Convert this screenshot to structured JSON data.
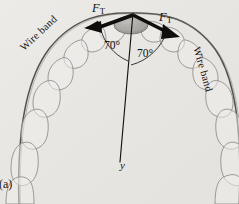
{
  "figure": {
    "panel_label": "(a)",
    "background_color": "#e9e7e4",
    "ink_color": "#14110f",
    "tooth_outline_color": "#8d8a86",
    "band_color": "#6f6c68",
    "bracket_fill": "#a7a5a2"
  },
  "labels": {
    "force_left": "F",
    "force_left_sub": "T",
    "force_right": "F",
    "force_right_sub": "T",
    "angle_left": "70°",
    "angle_right": "70°",
    "wire_band_left": "Wire band",
    "wire_band_right": "Wire band",
    "y_axis": "y"
  },
  "diagram_data": {
    "type": "free-body-diagram",
    "subject": "orthodontic wire band on dental arch",
    "vertex": {
      "x": 133,
      "y": 14
    },
    "angle_between_force_and_y_axis_deg": 70,
    "forces": [
      {
        "name": "F_T",
        "side": "left",
        "magnitude_label": "F_T",
        "direction_deg_from_y_axis": 70
      },
      {
        "name": "F_T",
        "side": "right",
        "magnitude_label": "F_T",
        "direction_deg_from_y_axis": 70
      }
    ],
    "axes": [
      {
        "name": "y",
        "from": {
          "x": 133,
          "y": 14
        },
        "to": {
          "x": 120,
          "y": 162
        }
      }
    ],
    "tooth_count_left": 7,
    "tooth_count_right": 7
  }
}
